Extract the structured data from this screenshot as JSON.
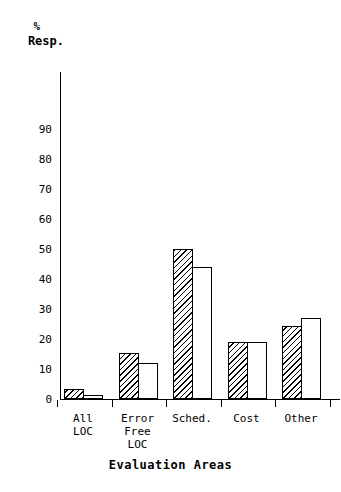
{
  "chart_data": {
    "type": "bar",
    "title": "",
    "xlabel": "Evaluation Areas",
    "ylabel": "% Resp.",
    "ylabel_lines": [
      "%",
      "Resp."
    ],
    "categories": [
      "All LOC",
      "Error Free LOC",
      "Sched.",
      "Cost",
      "Other"
    ],
    "category_lines": [
      [
        "All",
        "LOC"
      ],
      [
        "Error",
        "Free",
        "LOC"
      ],
      [
        "Sched."
      ],
      [
        "Cost"
      ],
      [
        "Other"
      ]
    ],
    "series": [
      {
        "name": "hatched",
        "fill": "diagonal-hatch",
        "values": [
          3.5,
          15.5,
          50,
          19,
          24.5
        ]
      },
      {
        "name": "open",
        "fill": "white",
        "values": [
          1.5,
          12,
          44,
          19,
          27
        ]
      }
    ],
    "ylim": [
      0,
      95
    ],
    "yticks": [
      0,
      10,
      20,
      30,
      40,
      50,
      60,
      70,
      80,
      90
    ],
    "ytick_labels": [
      "0",
      "10",
      "20",
      "30",
      "40",
      "50",
      "60",
      "70",
      "80",
      "90"
    ],
    "grid": false,
    "legend": "none",
    "line_color": "#000000",
    "background_color": "#ffffff"
  }
}
